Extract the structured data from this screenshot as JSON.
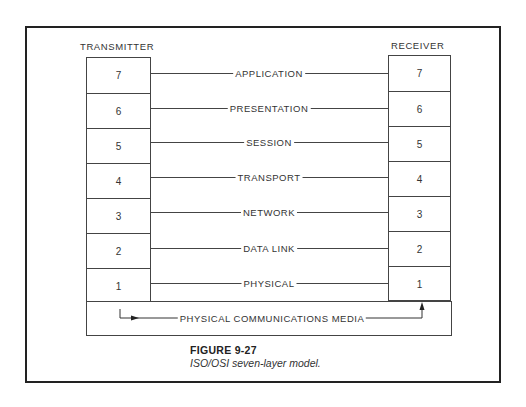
{
  "diagram": {
    "transmitter_label": "TRANSMITTER",
    "receiver_label": "RECEIVER",
    "layers": [
      {
        "number": "7",
        "name": "APPLICATION"
      },
      {
        "number": "6",
        "name": "PRESENTATION"
      },
      {
        "number": "5",
        "name": "SESSION"
      },
      {
        "number": "4",
        "name": "TRANSPORT"
      },
      {
        "number": "3",
        "name": "NETWORK"
      },
      {
        "number": "2",
        "name": "DATA LINK"
      },
      {
        "number": "1",
        "name": "PHYSICAL"
      }
    ],
    "media_label": "PHYSICAL COMMUNICATIONS MEDIA"
  },
  "caption": {
    "figure": "FIGURE 9-27",
    "text": "ISO/OSI seven-layer model."
  }
}
